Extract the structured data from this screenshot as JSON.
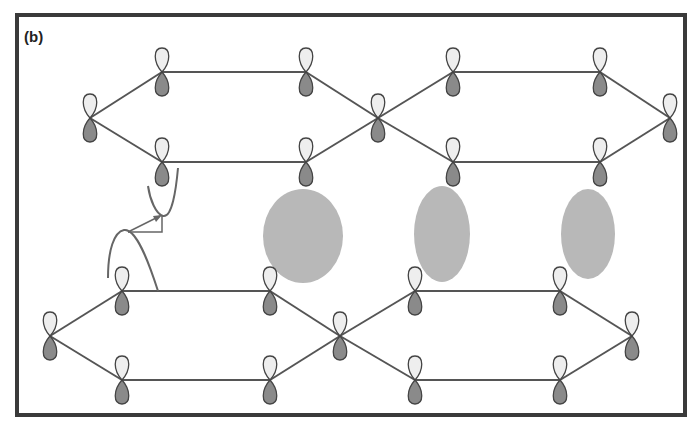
{
  "figure": {
    "panel_label": "(b)",
    "colors": {
      "bond": "#555555",
      "orbital_light": "#eeeeee",
      "orbital_dark": "#8a8a8a",
      "orbital_outline": "#444444",
      "density_oval": "#b8b8b8",
      "frame": "#3a3a3a"
    },
    "layers": [
      {
        "name": "top-layer",
        "vertices": [
          [
            90,
            118
          ],
          [
            162,
            72
          ],
          [
            306,
            72
          ],
          [
            378,
            118
          ],
          [
            306,
            162
          ],
          [
            162,
            162
          ],
          [
            453,
            72
          ],
          [
            600,
            72
          ],
          [
            670,
            118
          ],
          [
            600,
            162
          ],
          [
            453,
            162
          ]
        ],
        "bonds": [
          [
            0,
            1
          ],
          [
            1,
            2
          ],
          [
            2,
            3
          ],
          [
            3,
            4
          ],
          [
            4,
            5
          ],
          [
            5,
            0
          ],
          [
            3,
            6
          ],
          [
            6,
            7
          ],
          [
            7,
            8
          ],
          [
            8,
            9
          ],
          [
            9,
            10
          ],
          [
            10,
            3
          ]
        ]
      },
      {
        "name": "bottom-layer",
        "vertices": [
          [
            50,
            336
          ],
          [
            122,
            291
          ],
          [
            270,
            291
          ],
          [
            340,
            336
          ],
          [
            270,
            380
          ],
          [
            122,
            380
          ],
          [
            415,
            291
          ],
          [
            560,
            291
          ],
          [
            632,
            336
          ],
          [
            560,
            380
          ],
          [
            415,
            380
          ]
        ],
        "bonds": [
          [
            0,
            1
          ],
          [
            1,
            2
          ],
          [
            2,
            3
          ],
          [
            3,
            4
          ],
          [
            4,
            5
          ],
          [
            5,
            0
          ],
          [
            3,
            6
          ],
          [
            6,
            7
          ],
          [
            7,
            8
          ],
          [
            8,
            9
          ],
          [
            9,
            10
          ],
          [
            10,
            3
          ]
        ]
      }
    ],
    "density_ovals": [
      {
        "cx": 303,
        "cy": 236,
        "rx": 40,
        "ry": 47
      },
      {
        "cx": 442,
        "cy": 234,
        "rx": 28,
        "ry": 48
      },
      {
        "cx": 588,
        "cy": 234,
        "rx": 27,
        "ry": 45
      }
    ]
  }
}
